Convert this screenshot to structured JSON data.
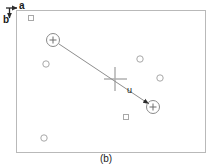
{
  "figure": {
    "caption": "(b)",
    "axes": {
      "horizontal_label": "a",
      "vertical_label": "b",
      "origin": [
        14,
        8
      ],
      "a_arrow_end": [
        27,
        8
      ],
      "b_arrow_end": [
        14,
        22
      ]
    },
    "frame": {
      "x": 16,
      "y": 10,
      "width": 190,
      "height": 143,
      "stroke": "#b9b9b9",
      "fill": "#ffffff"
    },
    "vector": {
      "label": "u",
      "label_pos": [
        127,
        86
      ],
      "start": [
        53,
        40
      ],
      "end": [
        152,
        106
      ],
      "stroke": "#8e8e8e",
      "arrowhead": true
    },
    "marked_points": [
      {
        "name": "vector-start-point",
        "cx": 53,
        "cy": 40,
        "r": 6.5,
        "glyph": "plus"
      },
      {
        "name": "vector-end-point",
        "cx": 153,
        "cy": 107,
        "r": 6.5,
        "glyph": "plus"
      }
    ],
    "centroid_cross": {
      "name": "centroid-cross",
      "cx": 115,
      "cy": 79,
      "half_length": 12,
      "stroke": "#adadad"
    },
    "scatter_points": [
      {
        "cx": 31,
        "cy": 18,
        "r": 3.0,
        "shape": "square"
      },
      {
        "cx": 46,
        "cy": 64,
        "r": 3.2,
        "shape": "circle"
      },
      {
        "cx": 140,
        "cy": 59,
        "r": 3.2,
        "shape": "circle"
      },
      {
        "cx": 160,
        "cy": 78,
        "r": 3.2,
        "shape": "circle"
      },
      {
        "cx": 126,
        "cy": 117,
        "r": 3.0,
        "shape": "square"
      },
      {
        "cx": 44,
        "cy": 138,
        "r": 3.2,
        "shape": "circle"
      }
    ],
    "colors": {
      "frame_stroke": "#b9b9b9",
      "marker_stroke": "#a0a0a0",
      "vector_stroke": "#8e8e8e",
      "cross_stroke": "#adadad",
      "axis_stroke": "#2b2b2b",
      "text": "#1a1a1a",
      "background": "#ffffff"
    }
  }
}
